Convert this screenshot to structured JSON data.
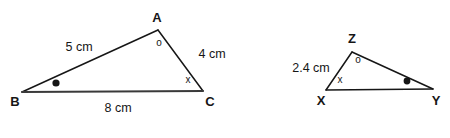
{
  "figure": {
    "background_color": "#ffffff",
    "stroke_color": "#161616",
    "text_color": "#161616"
  },
  "triangle_abc": {
    "name": "triangle-abc",
    "vertices": [
      {
        "id": "A",
        "label": "A",
        "x": 158,
        "y": 30,
        "label_x": 157,
        "label_y": 17
      },
      {
        "id": "B",
        "label": "B",
        "x": 22,
        "y": 92,
        "label_x": 15,
        "label_y": 101
      },
      {
        "id": "C",
        "label": "C",
        "x": 203,
        "y": 91,
        "label_x": 210,
        "label_y": 101
      }
    ],
    "sides": [
      {
        "id": "AB",
        "label": "5 cm",
        "label_x": 79,
        "label_y": 47
      },
      {
        "id": "AC",
        "label": "4 cm",
        "label_x": 212,
        "label_y": 54
      },
      {
        "id": "BC",
        "label": "8 cm",
        "label_x": 118,
        "label_y": 108
      }
    ],
    "angle_marks": [
      {
        "at": "A",
        "mark": "o",
        "x": 159,
        "y": 43
      },
      {
        "at": "C",
        "mark": "x",
        "x": 188,
        "y": 80
      },
      {
        "at": "B",
        "mark": "dot",
        "x": 56,
        "y": 83,
        "radius": 3.6
      }
    ]
  },
  "triangle_xyz": {
    "name": "triangle-xyz",
    "vertices": [
      {
        "id": "Z",
        "label": "Z",
        "x": 352,
        "y": 52,
        "label_x": 352,
        "label_y": 38
      },
      {
        "id": "X",
        "label": "X",
        "x": 326,
        "y": 90,
        "label_x": 321,
        "label_y": 100
      },
      {
        "id": "Y",
        "label": "Y",
        "x": 433,
        "y": 89,
        "label_x": 436,
        "label_y": 100
      }
    ],
    "sides": [
      {
        "id": "XZ",
        "label": "2.4 cm",
        "label_x": 311,
        "label_y": 68
      }
    ],
    "angle_marks": [
      {
        "at": "Z",
        "mark": "o",
        "x": 358,
        "y": 60
      },
      {
        "at": "X",
        "mark": "x",
        "x": 340,
        "y": 80
      },
      {
        "at": "Y",
        "mark": "dot",
        "x": 407,
        "y": 81,
        "radius": 3.4
      }
    ]
  }
}
